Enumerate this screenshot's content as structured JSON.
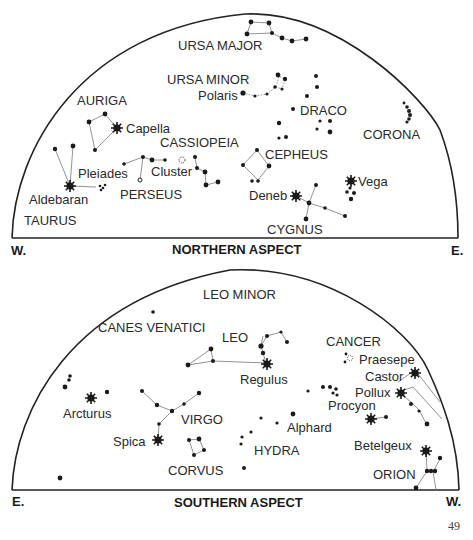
{
  "north": {
    "aspect_label": "NORTHERN ASPECT",
    "left_dir": "W.",
    "right_dir": "E.",
    "labels": {
      "ursa_major": "URSA MAJOR",
      "ursa_minor": "URSA MINOR",
      "polaris": "Polaris",
      "auriga": "AURIGA",
      "capella": "Capella",
      "draco": "DRACO",
      "corona": "CORONA",
      "cassiopeia": "CASSIOPEIA",
      "cepheus": "CEPHEUS",
      "pleiades": "Pleiades",
      "cluster": "Cluster",
      "perseus": "PERSEUS",
      "aldebaran": "Aldebaran",
      "taurus": "TAURUS",
      "deneb": "Deneb",
      "vega": "Vega",
      "cygnus": "CYGNUS"
    }
  },
  "south": {
    "aspect_label": "SOUTHERN ASPECT",
    "left_dir": "E.",
    "right_dir": "W.",
    "labels": {
      "leo_minor": "LEO MINOR",
      "canes_venatici": "CANES VENATICI",
      "leo": "LEO",
      "regulus": "Regulus",
      "cancer": "CANCER",
      "praesepe": "Praesepe",
      "castor": "Castor",
      "pollux": "Pollux",
      "procyon": "Procyon",
      "arcturus": "Arcturus",
      "virgo": "VIRGO",
      "alphard": "Alphard",
      "spica": "Spica",
      "hydra": "HYDRA",
      "corvus": "CORVUS",
      "betelgeux": "Betelgeux",
      "orion": "ORION"
    }
  },
  "page_number": "49"
}
